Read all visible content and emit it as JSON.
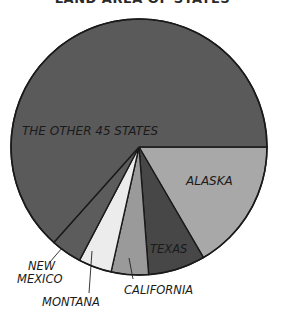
{
  "chart_data": {
    "type": "pie",
    "title": "LAND AREA OF STATES",
    "unit": "percent of total land area",
    "slices": [
      {
        "label": "ALASKA",
        "value": 16.6,
        "color": "#a8a8a8",
        "label_style": "inside"
      },
      {
        "label": "TEXAS",
        "value": 7.2,
        "color": "#474747",
        "label_style": "inside"
      },
      {
        "label": "CALIFORNIA",
        "value": 4.7,
        "color": "#9a9a9a",
        "label_style": "leader"
      },
      {
        "label": "MONTANA",
        "value": 4.2,
        "color": "#ececec",
        "label_style": "leader"
      },
      {
        "label": "NEW MEXICO",
        "value": 3.9,
        "color": "#5c5c5c",
        "label_style": "leader"
      },
      {
        "label": "THE OTHER 45 STATES",
        "value": 63.4,
        "color": "#5a5a5a",
        "label_style": "inside"
      }
    ],
    "start_angle_deg": 0,
    "direction": "clockwise",
    "legend": "none"
  },
  "labels": {
    "title": "LAND AREA OF STATES",
    "alaska": "ALASKA",
    "texas": "TEXAS",
    "california": "CALIFORNIA",
    "montana": "MONTANA",
    "new_mexico_line1": "NEW",
    "new_mexico_line2": "MEXICO",
    "other": "THE OTHER 45 STATES"
  }
}
